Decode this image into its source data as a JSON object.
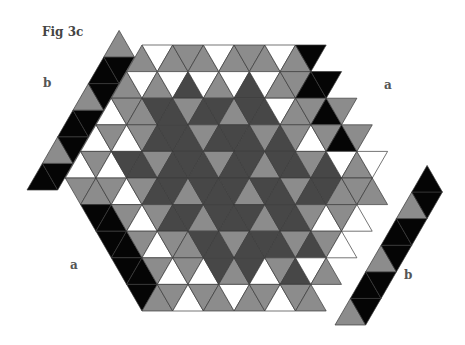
{
  "figure": {
    "title": "Fig 3c",
    "labels": [
      {
        "id": "label-b-upper",
        "text": "b",
        "x": 43,
        "y": 76
      },
      {
        "id": "label-a-right",
        "text": "a",
        "x": 384,
        "y": 78
      },
      {
        "id": "label-a-left",
        "text": "a",
        "x": 70,
        "y": 258
      },
      {
        "id": "label-b-lower",
        "text": "b",
        "x": 404,
        "y": 268
      }
    ],
    "colors": {
      "W": "#ffffff",
      "G": "#8c8c8c",
      "D": "#474747",
      "K": "#050505",
      "stroke": "#3a3a3a"
    },
    "hexagon": {
      "unit": 30.7,
      "row_height": 26.6,
      "top_left_x": 142,
      "top_y": 45,
      "side": 5,
      "rows": [
        "GWGGGWGGGWGK K",
        "GWGWDWGWDWGGKK",
        "WGGDDGDDGDDWGGK",
        "WGWGDDDGDDDGDGWGK",
        "WGWDDGDDDGDDGDDGDWGW",
        "GGGWGDDGDDDGDDGDDGGGW",
        "KKGWGDDGDDDGDDGWGWGG",
        "KKGWGGDDGDDDGDGWGWG",
        "KKGWGWDGDWGDWGWGW",
        "KGGWGGWGGWGGWG"
      ]
    },
    "strips": [
      {
        "id": "strip-b-upper",
        "name": "b",
        "direction": "up-right",
        "origin": [
          27,
          190
        ],
        "cells": "KKGKKKGKKKG"
      },
      {
        "id": "strip-b-lower",
        "name": "b",
        "direction": "up-right",
        "origin": [
          335,
          325
        ],
        "cells": "GKKKGKKKGKK"
      }
    ]
  }
}
